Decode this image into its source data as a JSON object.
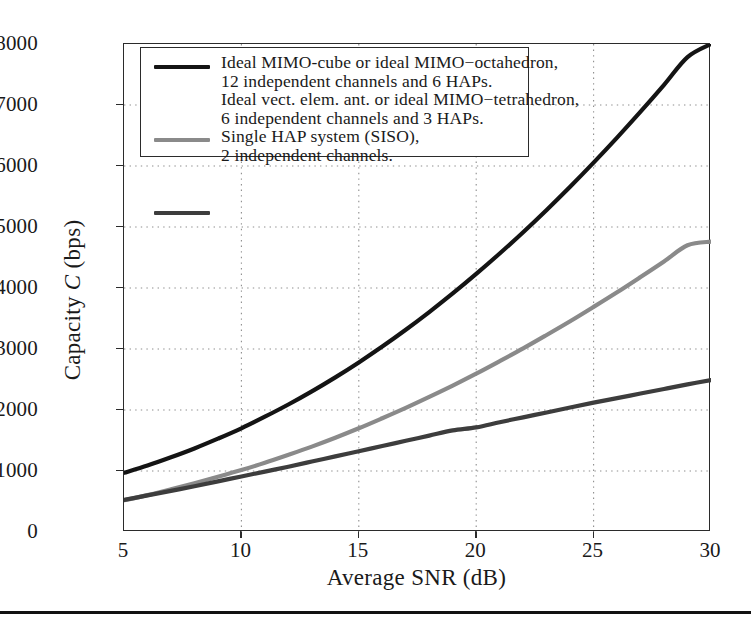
{
  "chart_data": {
    "type": "line",
    "title": "",
    "xlabel": "Average SNR (dB)",
    "ylabel": "Capacity C (bps)",
    "ylabel_plain": "Capacity",
    "ylabel_italic": "C",
    "ylabel_unit": "(bps)",
    "xlim": [
      5,
      30
    ],
    "ylim": [
      0,
      8000
    ],
    "xticks": [
      5,
      10,
      15,
      20,
      25,
      30
    ],
    "yticks": [
      0,
      1000,
      2000,
      3000,
      4000,
      5000,
      6000,
      7000,
      8000
    ],
    "grid": "dotted",
    "legend_position": "upper-left",
    "x": [
      5,
      6,
      7,
      8,
      9,
      10,
      11,
      12,
      13,
      14,
      15,
      16,
      17,
      18,
      19,
      20,
      21,
      22,
      23,
      24,
      25,
      26,
      27,
      28,
      29,
      30
    ],
    "series": [
      {
        "name": "Ideal MIMO-cube or ideal MIMO-octahedron, 12 independent channels and 6 HAPs.",
        "color": "#141414",
        "width": 4.2,
        "values": [
          970,
          1090,
          1225,
          1370,
          1530,
          1700,
          1890,
          2090,
          2305,
          2535,
          2780,
          3040,
          3315,
          3605,
          3910,
          4230,
          4565,
          4915,
          5280,
          5660,
          6055,
          6465,
          6890,
          7330,
          7785,
          8000
        ]
      },
      {
        "name": "Ideal vect. elem. ant. or ideal MIMO-tetrahedron, 6 independent channels and 3 HAPs.",
        "color": "#8a8a8a",
        "width": 4.2,
        "values": [
          520,
          605,
          700,
          800,
          905,
          1015,
          1135,
          1265,
          1400,
          1545,
          1700,
          1865,
          2035,
          2215,
          2400,
          2595,
          2800,
          3010,
          3230,
          3455,
          3690,
          3930,
          4180,
          4435,
          4700,
          4760
        ]
      },
      {
        "name": "Single HAP system (SISO), 2 independent channels.",
        "color": "#3d3d3d",
        "width": 4.2,
        "values": [
          525,
          600,
          675,
          750,
          830,
          910,
          990,
          1070,
          1155,
          1240,
          1325,
          1410,
          1495,
          1580,
          1665,
          1715,
          1800,
          1880,
          1960,
          2040,
          2120,
          2195,
          2270,
          2345,
          2420,
          2490
        ]
      }
    ]
  },
  "axes": {
    "xlabel": "Average SNR (dB)",
    "xticklabels": [
      "5",
      "10",
      "15",
      "20",
      "25",
      "30"
    ],
    "yticklabels": [
      "0",
      "1000",
      "2000",
      "3000",
      "4000",
      "5000",
      "6000",
      "7000",
      "8000"
    ]
  },
  "legend": {
    "entries": [
      {
        "line1": "Ideal MIMO-cube or ideal MIMO−octahedron,",
        "line2": "12 independent channels and 6 HAPs.",
        "color": "#141414"
      },
      {
        "line1": "Ideal vect. elem. ant. or ideal MIMO−tetrahedron,",
        "line2": "6 independent channels and 3 HAPs.",
        "color": "#8a8a8a"
      },
      {
        "line1": "Single HAP system (SISO),",
        "line2": "2 independent channels.",
        "color": "#3d3d3d"
      }
    ]
  }
}
